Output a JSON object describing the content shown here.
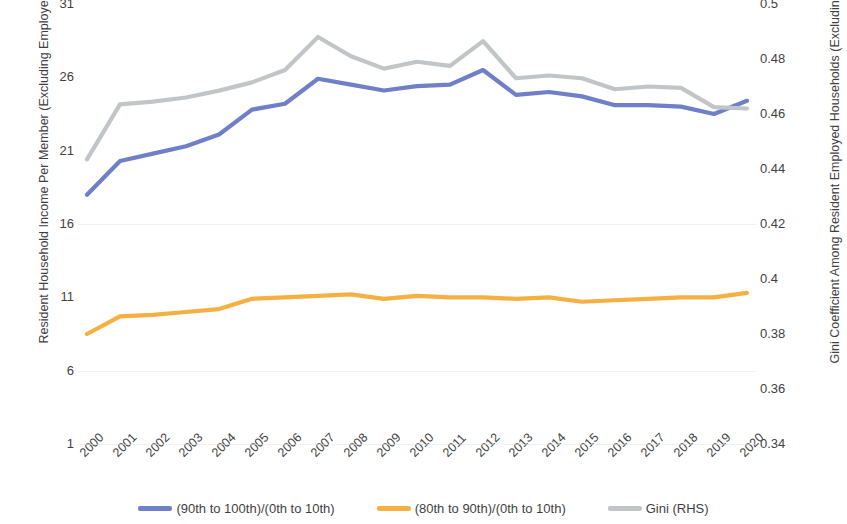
{
  "chart_data": {
    "type": "line",
    "title": "",
    "subtitle": "",
    "xlabel": "",
    "ylabel": "Resident Household Income Per Member (Excluding Employer CPF)",
    "y2label": "Gini Coefficient Among Resident Employed Households (Excluding Employer CPF)",
    "grid": false,
    "legend_position": "bottom",
    "categories": [
      "2000",
      "2001",
      "2002",
      "2003",
      "2004",
      "2005",
      "2006",
      "2007",
      "2008",
      "2009",
      "2010",
      "2011",
      "2012",
      "2013",
      "2014",
      "2015",
      "2016",
      "2017",
      "2018",
      "2019",
      "2020"
    ],
    "ylim": [
      1,
      31
    ],
    "yticks": [
      "1",
      "6",
      "11",
      "16",
      "21",
      "26",
      "31"
    ],
    "ytick_values": [
      1,
      6,
      11,
      16,
      21,
      26,
      31
    ],
    "y2lim": [
      0.34,
      0.5
    ],
    "y2ticks": [
      "0.34",
      "0.36",
      "0.38",
      "0.4",
      "0.42",
      "0.44",
      "0.46",
      "0.48",
      "0.5"
    ],
    "y2tick_values": [
      0.34,
      0.36,
      0.38,
      0.4,
      0.42,
      0.44,
      0.46,
      0.48,
      0.5
    ],
    "series": [
      {
        "name": "(90th to 100th)/(0th to 10th)",
        "axis": "left",
        "color": "#6F80C8",
        "values": [
          18.0,
          20.3,
          20.8,
          21.3,
          22.1,
          23.8,
          24.2,
          25.9,
          25.5,
          25.1,
          25.4,
          25.5,
          26.5,
          24.8,
          25.0,
          24.7,
          24.1,
          24.1,
          24.0,
          23.5,
          24.4
        ]
      },
      {
        "name": "(80th to 90th)/(0th to 10th)",
        "axis": "left",
        "color": "#F5B041",
        "values": [
          8.5,
          9.7,
          9.8,
          10.0,
          10.2,
          10.9,
          11.0,
          11.1,
          11.2,
          10.9,
          11.1,
          11.0,
          11.0,
          10.9,
          11.0,
          10.7,
          10.8,
          10.9,
          11.0,
          11.0,
          11.3
        ]
      },
      {
        "name": "Gini (RHS)",
        "axis": "right",
        "color": "#C2C5C7",
        "values": [
          0.4435,
          0.4635,
          0.4645,
          0.466,
          0.4685,
          0.4715,
          0.476,
          0.488,
          0.481,
          0.4765,
          0.479,
          0.4775,
          0.4865,
          0.473,
          0.474,
          0.473,
          0.469,
          0.47,
          0.4695,
          0.4625,
          0.462
        ]
      }
    ]
  },
  "legend": {
    "items": [
      {
        "label": "(90th to 100th)/(0th to 10th)",
        "color": "#6F80C8"
      },
      {
        "label": "(80th to 90th)/(0th to 10th)",
        "color": "#F5B041"
      },
      {
        "label": "Gini (RHS)",
        "color": "#C2C5C7"
      }
    ]
  }
}
